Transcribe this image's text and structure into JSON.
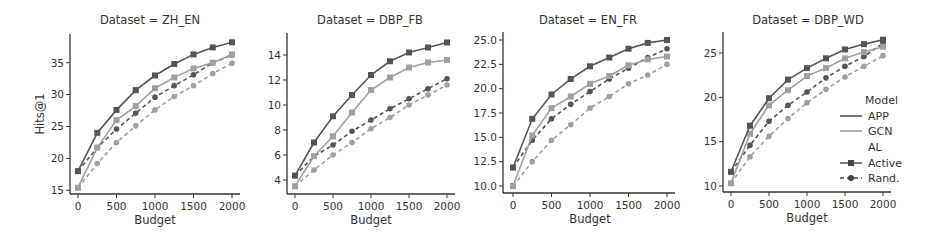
{
  "figure": {
    "xlabel": "Budget",
    "ylabel": "Hits@1"
  },
  "legend": {
    "header_model": "Model",
    "model_items": [
      {
        "label": "APP",
        "color": "#555555"
      },
      {
        "label": "GCN",
        "color": "#a0a0a0"
      }
    ],
    "header_al": "AL",
    "al_items": [
      {
        "label": "Active",
        "marker": "square",
        "dash": "solid"
      },
      {
        "label": "Rand.",
        "marker": "circle",
        "dash": "dashed"
      }
    ]
  },
  "chart_data": [
    {
      "type": "line",
      "title": "Dataset = ZH_EN",
      "xlabel": "Budget",
      "ylabel": "Hits@1",
      "x": [
        0,
        250,
        500,
        750,
        1000,
        1250,
        1500,
        1750,
        2000
      ],
      "xticks": [
        0,
        500,
        1000,
        1500,
        2000
      ],
      "yticks": [
        15,
        20,
        25,
        30,
        35
      ],
      "ylim": [
        14.5,
        39.5
      ],
      "grid": false,
      "series": [
        {
          "name": "APP / Active",
          "values": [
            18.0,
            24.0,
            27.6,
            30.7,
            33.0,
            34.8,
            36.3,
            37.4,
            38.2
          ]
        },
        {
          "name": "GCN / Active",
          "values": [
            15.4,
            21.7,
            26.0,
            28.2,
            31.0,
            32.7,
            34.1,
            35.0,
            36.3
          ]
        },
        {
          "name": "APP / Rand.",
          "values": [
            18.0,
            21.7,
            24.6,
            27.1,
            29.6,
            31.4,
            33.1,
            35.0,
            36.2
          ]
        },
        {
          "name": "GCN / Rand.",
          "values": [
            15.4,
            19.2,
            22.5,
            25.1,
            27.6,
            29.7,
            31.4,
            33.3,
            34.9
          ]
        }
      ]
    },
    {
      "type": "line",
      "title": "Dataset = DBP_FB",
      "xlabel": "Budget",
      "ylabel": "",
      "x": [
        0,
        250,
        500,
        750,
        1000,
        1250,
        1500,
        1750,
        2000
      ],
      "xticks": [
        0,
        500,
        1000,
        1500,
        2000
      ],
      "yticks": [
        4,
        6,
        8,
        10,
        12,
        14
      ],
      "ylim": [
        3.0,
        15.8
      ],
      "grid": false,
      "series": [
        {
          "name": "APP / Active",
          "values": [
            4.35,
            7.0,
            9.1,
            10.8,
            12.4,
            13.5,
            14.2,
            14.6,
            15.0
          ]
        },
        {
          "name": "GCN / Active",
          "values": [
            3.5,
            5.9,
            7.5,
            9.4,
            11.2,
            12.2,
            13.0,
            13.4,
            13.6
          ]
        },
        {
          "name": "APP / Rand.",
          "values": [
            4.35,
            5.9,
            6.8,
            7.9,
            8.8,
            9.7,
            10.5,
            11.3,
            12.1
          ]
        },
        {
          "name": "GCN / Rand.",
          "values": [
            3.5,
            4.8,
            6.0,
            7.0,
            8.1,
            9.0,
            10.0,
            10.8,
            11.6
          ]
        }
      ]
    },
    {
      "type": "line",
      "title": "Dataset = EN_FR",
      "xlabel": "Budget",
      "ylabel": "",
      "x": [
        0,
        250,
        500,
        750,
        1000,
        1250,
        1500,
        1750,
        2000
      ],
      "xticks": [
        0,
        500,
        1000,
        1500,
        2000
      ],
      "yticks": [
        10.0,
        12.5,
        15.0,
        17.5,
        20.0,
        22.5,
        25.0
      ],
      "ylim": [
        9.3,
        25.8
      ],
      "grid": false,
      "series": [
        {
          "name": "APP / Active",
          "values": [
            11.9,
            16.9,
            19.4,
            21.0,
            22.3,
            23.2,
            24.1,
            24.7,
            25.0
          ]
        },
        {
          "name": "GCN / Active",
          "values": [
            10.0,
            15.2,
            18.0,
            19.2,
            20.5,
            21.3,
            22.4,
            23.0,
            23.3
          ]
        },
        {
          "name": "APP / Rand.",
          "values": [
            11.9,
            14.7,
            16.9,
            18.4,
            19.7,
            21.0,
            22.1,
            23.2,
            24.1
          ]
        },
        {
          "name": "GCN / Rand.",
          "values": [
            10.0,
            12.5,
            14.7,
            16.3,
            18.0,
            19.2,
            20.5,
            21.4,
            22.5
          ]
        }
      ]
    },
    {
      "type": "line",
      "title": "Dataset = DBP_WD",
      "xlabel": "Budget",
      "ylabel": "",
      "x": [
        0,
        250,
        500,
        750,
        1000,
        1250,
        1500,
        1750,
        2000
      ],
      "xticks": [
        0,
        500,
        1000,
        1500,
        2000
      ],
      "yticks": [
        10,
        15,
        20,
        25
      ],
      "ylim": [
        9.3,
        27.4
      ],
      "grid": false,
      "series": [
        {
          "name": "APP / Active",
          "values": [
            11.6,
            16.8,
            19.9,
            22.0,
            23.3,
            24.4,
            25.4,
            26.0,
            26.5
          ]
        },
        {
          "name": "GCN / Active",
          "values": [
            10.3,
            15.9,
            19.1,
            20.8,
            22.4,
            23.3,
            24.4,
            25.1,
            25.7
          ]
        },
        {
          "name": "APP / Rand.",
          "values": [
            11.6,
            14.6,
            17.3,
            19.1,
            20.6,
            22.2,
            23.5,
            24.6,
            26.1
          ]
        },
        {
          "name": "GCN / Rand.",
          "values": [
            10.3,
            13.3,
            15.6,
            17.6,
            19.4,
            20.9,
            22.3,
            23.5,
            24.7
          ]
        }
      ]
    }
  ]
}
